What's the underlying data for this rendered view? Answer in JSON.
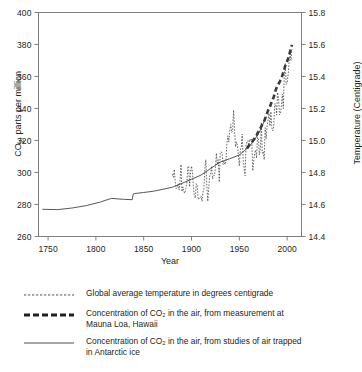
{
  "chart_data": {
    "type": "line",
    "title": "",
    "xlabel": "Year",
    "ylabel_left": "CO2, parts per million",
    "ylabel_right": "Temperature (Centigrade)",
    "xlim": [
      1740,
      2015
    ],
    "ylim_left": [
      260,
      400
    ],
    "ylim_right": [
      14.4,
      15.8
    ],
    "xticks": [
      1750,
      1800,
      1850,
      1900,
      1950,
      2000
    ],
    "yticks_left": [
      260,
      280,
      300,
      320,
      340,
      360,
      380,
      400
    ],
    "yticks_right": [
      "14.4",
      "14.6",
      "14.8",
      "15.0",
      "15.2",
      "15.4",
      "15.6",
      "15.8"
    ],
    "grid": false,
    "legend_position": "below",
    "series": [
      {
        "name": "Global average temperature in degrees centigrade",
        "style": "fine-dotted",
        "axis": "right",
        "x": [
          1880,
          1881,
          1882,
          1883,
          1884,
          1885,
          1886,
          1887,
          1888,
          1889,
          1890,
          1891,
          1892,
          1893,
          1894,
          1895,
          1896,
          1897,
          1898,
          1899,
          1900,
          1901,
          1902,
          1903,
          1904,
          1905,
          1906,
          1907,
          1908,
          1909,
          1910,
          1911,
          1912,
          1913,
          1914,
          1915,
          1916,
          1917,
          1918,
          1919,
          1920,
          1921,
          1922,
          1923,
          1924,
          1925,
          1926,
          1927,
          1928,
          1929,
          1930,
          1931,
          1932,
          1933,
          1934,
          1935,
          1936,
          1937,
          1938,
          1939,
          1940,
          1941,
          1942,
          1943,
          1944,
          1945,
          1946,
          1947,
          1948,
          1949,
          1950,
          1951,
          1952,
          1953,
          1954,
          1955,
          1956,
          1957,
          1958,
          1959,
          1960,
          1961,
          1962,
          1963,
          1964,
          1965,
          1966,
          1967,
          1968,
          1969,
          1970,
          1971,
          1972,
          1973,
          1974,
          1975,
          1976,
          1977,
          1978,
          1979,
          1980,
          1981,
          1982,
          1983,
          1984,
          1985,
          1986,
          1987,
          1988,
          1989,
          1990,
          1991,
          1992,
          1993,
          1994,
          1995,
          1996,
          1997,
          1998,
          1999,
          2000,
          2001,
          2002,
          2003,
          2004,
          2005
        ],
        "values": [
          14.79,
          14.77,
          14.82,
          14.74,
          14.7,
          14.71,
          14.73,
          14.69,
          14.75,
          14.85,
          14.68,
          14.71,
          14.68,
          14.67,
          14.7,
          14.72,
          14.83,
          14.84,
          14.71,
          14.8,
          14.84,
          14.8,
          14.71,
          14.65,
          14.64,
          14.73,
          14.72,
          14.63,
          14.64,
          14.64,
          14.65,
          14.62,
          14.68,
          14.7,
          14.83,
          14.88,
          14.72,
          14.62,
          14.7,
          14.78,
          14.79,
          14.84,
          14.76,
          14.78,
          14.78,
          14.83,
          14.92,
          14.85,
          14.88,
          14.74,
          14.92,
          14.93,
          14.92,
          14.85,
          14.87,
          14.85,
          14.87,
          14.98,
          15.03,
          14.99,
          15.06,
          15.1,
          15.05,
          15.06,
          15.19,
          15.07,
          14.96,
          14.99,
          14.97,
          14.91,
          14.84,
          14.94,
          14.96,
          15.04,
          14.88,
          14.83,
          14.78,
          14.97,
          14.99,
          15.0,
          14.96,
          15.01,
          15.0,
          15.01,
          14.81,
          14.87,
          14.92,
          14.94,
          14.89,
          15.02,
          15.01,
          14.91,
          14.95,
          15.11,
          14.92,
          14.93,
          14.88,
          15.08,
          15.01,
          15.09,
          15.13,
          15.17,
          15.09,
          15.18,
          15.08,
          15.06,
          15.09,
          15.23,
          15.23,
          15.16,
          15.3,
          15.26,
          15.16,
          15.17,
          15.22,
          15.29,
          15.2,
          15.41,
          15.48,
          15.35,
          15.36,
          15.41,
          15.49,
          15.54,
          15.5,
          15.57
        ]
      },
      {
        "name": "Concentration of CO2 in the air, from measurement at Mauna Loa, Hawaii",
        "style": "thick-dashed",
        "axis": "left",
        "x": [
          1958,
          1960,
          1962,
          1964,
          1966,
          1968,
          1970,
          1972,
          1974,
          1976,
          1978,
          1980,
          1982,
          1984,
          1986,
          1988,
          1990,
          1992,
          1994,
          1996,
          1998,
          2000,
          2002,
          2004,
          2005
        ],
        "values": [
          315,
          316.9,
          318.4,
          319.6,
          321.4,
          323.1,
          325.7,
          327.5,
          330.2,
          332.1,
          335.4,
          338.7,
          341.1,
          344.4,
          347.2,
          351.6,
          354.4,
          356.4,
          358.8,
          362.6,
          366.7,
          369.5,
          373.2,
          377.5,
          379.8
        ]
      },
      {
        "name": "Concentration of CO2 in the air, from studies of air trapped in Antarctic ice",
        "style": "thin-solid",
        "axis": "left",
        "x": [
          1744,
          1760,
          1775,
          1790,
          1805,
          1815,
          1816,
          1830,
          1838,
          1839,
          1840,
          1850,
          1860,
          1870,
          1880,
          1890,
          1900,
          1910,
          1920,
          1930,
          1940,
          1950,
          1958,
          1965,
          1972,
          1978
        ],
        "values": [
          277,
          276.8,
          277.8,
          279.3,
          281.6,
          283.6,
          283.8,
          283.2,
          283.0,
          286.5,
          286.8,
          287.5,
          288.3,
          289.5,
          290.8,
          293.2,
          295.8,
          298.4,
          302.5,
          306.5,
          308.6,
          311.0,
          315.0,
          319.5,
          326.5,
          335.0
        ]
      }
    ]
  },
  "legend": {
    "items": [
      {
        "key": "fine-dotted",
        "lines": [
          "Global average temperature in degrees centigrade"
        ]
      },
      {
        "key": "thick-dashed",
        "lines": [
          "Concentration of CO₂ in the air, from measurement at",
          "Mauna Loa, Hawaii"
        ]
      },
      {
        "key": "thin-solid",
        "lines": [
          "Concentration of CO₂ in the air, from studies of air trapped",
          "in Antarctic ice"
        ]
      }
    ]
  },
  "axes": {
    "x_title": "Year",
    "y_left_title_pre": "CO",
    "y_left_title_sub": "2",
    "y_left_title_post": ", parts per million",
    "y_right_title": "Temperature (Centigrade)"
  },
  "colors": {
    "ink": "#231f20",
    "frame": "#808080",
    "series": "#3a3a3a"
  }
}
